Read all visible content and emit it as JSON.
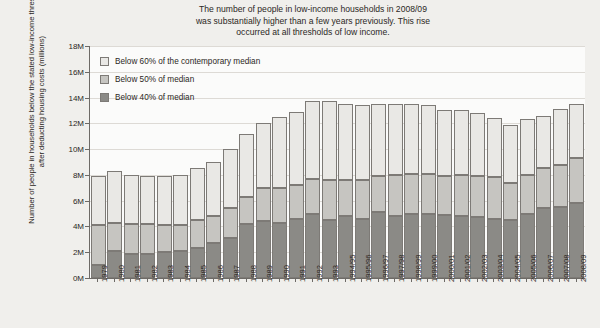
{
  "title": {
    "line1": "The number of people in low-income households in 2008/09",
    "line2": "was substantially higher than a few years previously. This rise",
    "line3": "occurred at all thresholds of low income."
  },
  "axis": {
    "y_title": "Number of people in households below the stated low-income thresholds after deducting housing costs (millions)"
  },
  "legend": {
    "items": [
      {
        "label": "Below 60% of the contemporary median",
        "color": "#e9e8e5",
        "swatch": "swatch-below-60"
      },
      {
        "label": "Below 50% of median",
        "color": "#c6c5c1",
        "swatch": "swatch-below-50"
      },
      {
        "label": "Below 40% of median",
        "color": "#8b8a86",
        "swatch": "swatch-below-40"
      }
    ]
  },
  "chart_data": {
    "type": "bar",
    "stacked": true,
    "title": "The number of people in low-income households in 2008/09 was substantially higher than a few years previously. This rise occurred at all thresholds of low income.",
    "xlabel": "",
    "ylabel": "Number of people in households below the stated low-income thresholds after deducting housing costs (millions)",
    "ylim": [
      0,
      18
    ],
    "yticks": [
      "0M",
      "2M",
      "4M",
      "6M",
      "8M",
      "10M",
      "12M",
      "14M",
      "16M",
      "18M"
    ],
    "ytick_values": [
      0,
      2,
      4,
      6,
      8,
      10,
      12,
      14,
      16,
      18
    ],
    "y_unit": "millions",
    "grid": true,
    "legend_position": "top-left",
    "categories": [
      "1979",
      "1980",
      "1981",
      "1982",
      "1983",
      "1984",
      "1985",
      "1986",
      "1987",
      "1988",
      "1989",
      "1990",
      "1991",
      "1992",
      "1993",
      "1994/95",
      "1995/96",
      "1996/97",
      "1997/98",
      "1998/99",
      "1999/00",
      "2000/01",
      "2001/02",
      "2002/03",
      "2003/04",
      "2004/05",
      "2005/06",
      "2006/07",
      "2007/08",
      "2008/09"
    ],
    "series": [
      {
        "name": "Below 40% of median",
        "color": "#8b8a86",
        "values": [
          1.0,
          2.1,
          1.9,
          1.9,
          2.0,
          2.1,
          2.3,
          2.7,
          3.1,
          4.2,
          4.4,
          4.3,
          4.6,
          5.0,
          4.5,
          4.8,
          4.6,
          5.1,
          4.8,
          5.0,
          5.0,
          4.9,
          4.8,
          4.7,
          4.6,
          4.5,
          5.0,
          5.4,
          5.5,
          5.8
        ]
      },
      {
        "name": "Below 50% of median",
        "color": "#c6c5c1",
        "values": [
          3.1,
          2.2,
          2.3,
          2.3,
          2.1,
          2.0,
          2.2,
          2.1,
          2.3,
          2.1,
          2.6,
          2.7,
          2.6,
          2.7,
          3.1,
          2.8,
          3.0,
          2.8,
          3.2,
          3.1,
          3.1,
          3.0,
          3.2,
          3.2,
          3.2,
          2.9,
          3.0,
          3.1,
          3.3,
          3.5
        ]
      },
      {
        "name": "Below 60% of the contemporary median",
        "color": "#e9e8e5",
        "values": [
          3.8,
          4.0,
          3.8,
          3.7,
          3.8,
          3.9,
          4.0,
          4.2,
          4.6,
          4.9,
          5.0,
          5.5,
          5.7,
          6.0,
          6.1,
          5.9,
          5.8,
          5.6,
          5.5,
          5.4,
          5.3,
          5.1,
          5.0,
          4.9,
          4.6,
          4.5,
          4.3,
          4.1,
          4.3,
          4.2
        ]
      }
    ],
    "totals": [
      7.9,
      8.3,
      8.0,
      7.9,
      7.9,
      8.0,
      8.5,
      9.0,
      10.0,
      11.2,
      12.0,
      12.5,
      12.9,
      13.7,
      13.7,
      13.5,
      13.4,
      13.5,
      13.5,
      13.5,
      13.4,
      13.0,
      13.0,
      12.8,
      12.4,
      11.9,
      12.3,
      12.6,
      13.1,
      13.5
    ]
  }
}
